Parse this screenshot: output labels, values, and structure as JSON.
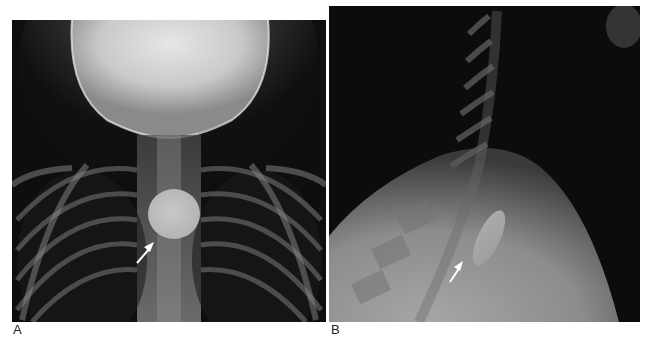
{
  "figure": {
    "panels": [
      {
        "id": "A",
        "label": "A",
        "view": "frontal radiograph of neck and upper chest",
        "finding": "round radiopaque foreign body (coin) in upper esophagus",
        "annotation": "arrow pointing to round object"
      },
      {
        "id": "B",
        "label": "B",
        "view": "lateral radiograph of neck and upper chest",
        "finding": "foreign body seen edge-on as elongated oval",
        "annotation": "arrow pointing to elongated object"
      }
    ]
  },
  "colors": {
    "background": "#ffffff",
    "film_dark": "#0c0c0c",
    "object": "#bdbdbd",
    "arrow": "#ffffff",
    "label_text": "#222222"
  }
}
